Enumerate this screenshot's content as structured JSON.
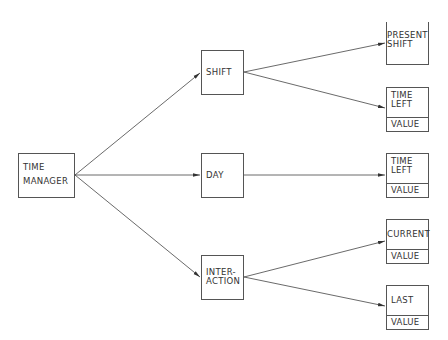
{
  "diagram": {
    "root": {
      "line1": "TIME",
      "line2": "MANAGER"
    },
    "level1": {
      "shift": {
        "label": "SHIFT"
      },
      "day": {
        "label": "DAY"
      },
      "interaction": {
        "line1": "INTER-",
        "line2": "ACTION"
      }
    },
    "level2": {
      "present_shift": {
        "line1": "PRESENT",
        "line2": "SHIFT"
      },
      "shift_time_left": {
        "line1": "TIME",
        "line2": "LEFT",
        "value": "VALUE"
      },
      "day_time_left": {
        "line1": "TIME",
        "line2": "LEFT",
        "value": "VALUE"
      },
      "current": {
        "label": "CURRENT",
        "value": "VALUE"
      },
      "last": {
        "label": "LAST",
        "value": "VALUE"
      }
    },
    "colors": {
      "line": "#444444",
      "background": "#ffffff"
    }
  }
}
